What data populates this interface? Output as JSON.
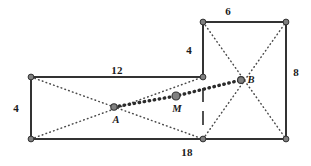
{
  "figure": {
    "colors": {
      "stroke": "#333333",
      "dotted": "#4a4a4a",
      "node_fill": "#808080",
      "node_stroke": "#333333",
      "background": "#ffffff",
      "text": "#1a1a1a"
    },
    "rectangles": [
      {
        "name": "left-rectangle",
        "x1": 31,
        "y1": 77,
        "x2": 203,
        "y2": 139,
        "diagonals": true
      },
      {
        "name": "right-rectangle",
        "x1": 203,
        "y1": 22,
        "x2": 286,
        "y2": 139,
        "diagonals": true
      }
    ],
    "vertices": [
      {
        "name": "left-rect-top-left",
        "x": 31,
        "y": 77
      },
      {
        "name": "left-rect-bottom-left",
        "x": 31,
        "y": 139
      },
      {
        "name": "shared-edge-top",
        "x": 203,
        "y": 77
      },
      {
        "name": "shared-edge-bottom",
        "x": 203,
        "y": 139
      },
      {
        "name": "right-rect-top-left",
        "x": 203,
        "y": 22
      },
      {
        "name": "right-rect-top-right",
        "x": 286,
        "y": 22
      },
      {
        "name": "right-rect-bottom-right",
        "x": 286,
        "y": 139
      }
    ],
    "dashed_segment": {
      "name": "dashed-divider",
      "x": 203,
      "y1": 88,
      "y2": 133
    },
    "bold_path": {
      "name": "bold-dotted-path-a-to-b",
      "from": {
        "x": 114,
        "y": 107
      },
      "via": {
        "x": 176,
        "y": 96
      },
      "to": {
        "x": 241,
        "y": 80
      }
    },
    "points": [
      {
        "name": "point-a",
        "label": "A",
        "x": 114,
        "y": 107,
        "label_x": 116,
        "label_y": 120,
        "r": 3.2
      },
      {
        "name": "point-m",
        "label": "M",
        "x": 176,
        "y": 96,
        "label_x": 177,
        "label_y": 109,
        "r": 4.0
      },
      {
        "name": "point-b",
        "label": "B",
        "x": 241,
        "y": 80,
        "label_x": 251,
        "label_y": 80,
        "r": 3.4
      }
    ],
    "dimension_labels": [
      {
        "name": "dimension-left-height",
        "text": "4",
        "x": 16,
        "y": 108
      },
      {
        "name": "dimension-left-top-width",
        "text": "12",
        "x": 117,
        "y": 70
      },
      {
        "name": "dimension-right-left-height",
        "text": "4",
        "x": 189,
        "y": 50
      },
      {
        "name": "dimension-right-top-width",
        "text": "6",
        "x": 228,
        "y": 11
      },
      {
        "name": "dimension-right-height",
        "text": "8",
        "x": 296,
        "y": 72
      },
      {
        "name": "dimension-bottom-width",
        "text": "18",
        "x": 187,
        "y": 152
      }
    ]
  }
}
